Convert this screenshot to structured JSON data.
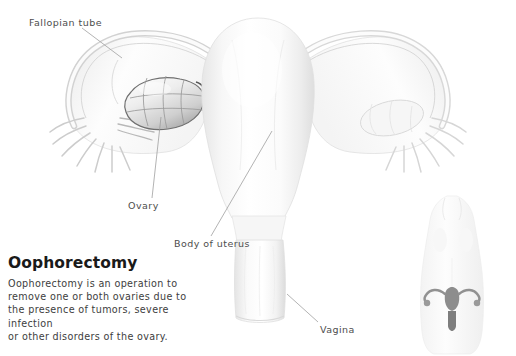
{
  "illustration": {
    "subject": "female reproductive system anatomy",
    "background_color": "#ffffff",
    "line_color": "#8a8a8a",
    "tumor_color": "#6f6f6f"
  },
  "labels": [
    {
      "key": "fallopian_tube",
      "text": "Fallopian tube"
    },
    {
      "key": "ovary",
      "text": "Ovary"
    },
    {
      "key": "body_of_uterus",
      "text": "Body of uterus"
    },
    {
      "key": "vagina",
      "text": "Vagina"
    }
  ],
  "info": {
    "title": "Oophorectomy",
    "lines": [
      "Oophorectomy is an operation to",
      "remove one or both ovaries due to",
      "the presence of tumors, severe infection",
      "or other disorders of the ovary."
    ]
  },
  "inset": {
    "description": "female torso silhouette with highlighted uterus and ovaries"
  }
}
